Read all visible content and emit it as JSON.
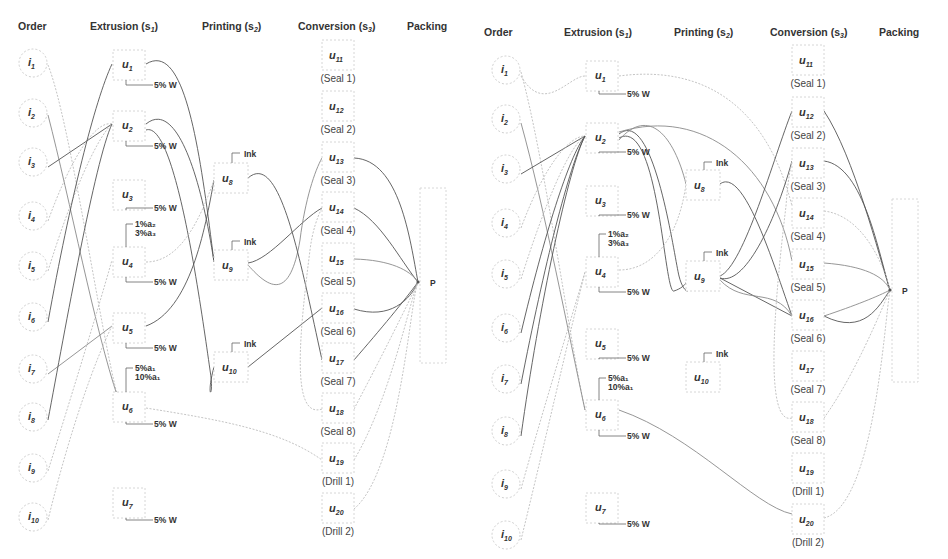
{
  "diagrams": [
    {
      "id": "left",
      "offset_x": 0,
      "offset_y": 0,
      "headers": [
        {
          "key": "order",
          "label": "Order",
          "x": 18,
          "y": 30
        },
        {
          "key": "extrusion",
          "label": "Extrusion (s",
          "sub": "1",
          "x": 90,
          "y": 30
        },
        {
          "key": "printing",
          "label": "Printing (s",
          "sub": "2",
          "x": 202,
          "y": 30
        },
        {
          "key": "conversion",
          "label": "Conversion (s",
          "sub": "3",
          "x": 298,
          "y": 30
        },
        {
          "key": "packing",
          "label": "Packing",
          "x": 407,
          "y": 30
        }
      ],
      "orders": [
        {
          "id": "i1",
          "label": "i",
          "sub": "1",
          "cx": 33,
          "cy": 63
        },
        {
          "id": "i2",
          "label": "i",
          "sub": "2",
          "cx": 33,
          "cy": 113
        },
        {
          "id": "i3",
          "label": "i",
          "sub": "3",
          "cx": 33,
          "cy": 162
        },
        {
          "id": "i4",
          "label": "i",
          "sub": "4",
          "cx": 33,
          "cy": 216
        },
        {
          "id": "i5",
          "label": "i",
          "sub": "5",
          "cx": 33,
          "cy": 266
        },
        {
          "id": "i6",
          "label": "i",
          "sub": "6",
          "cx": 33,
          "cy": 317
        },
        {
          "id": "i7",
          "label": "i",
          "sub": "7",
          "cx": 33,
          "cy": 369
        },
        {
          "id": "i8",
          "label": "i",
          "sub": "8",
          "cx": 33,
          "cy": 417
        },
        {
          "id": "i9",
          "label": "i",
          "sub": "9",
          "cx": 33,
          "cy": 468
        },
        {
          "id": "i10",
          "label": "i",
          "sub": "10",
          "cx": 33,
          "cy": 517
        }
      ],
      "extruders": [
        {
          "id": "u1",
          "label": "u",
          "sub": "1",
          "x": 113,
          "y": 50,
          "w": 32,
          "w2": 30,
          "note": "5% W",
          "note_y": 88
        },
        {
          "id": "u2",
          "label": "u",
          "sub": "2",
          "x": 113,
          "y": 111,
          "w": 32,
          "w2": 30,
          "note": "5% W",
          "note_y": 149
        },
        {
          "id": "u3",
          "label": "u",
          "sub": "3",
          "x": 113,
          "y": 180,
          "w": 32,
          "w2": 30,
          "note": "5% W",
          "note_y": 211
        },
        {
          "id": "u4",
          "label": "u",
          "sub": "4",
          "x": 113,
          "y": 247,
          "w": 32,
          "w2": 30,
          "note": "5% W",
          "note_y": 285,
          "pre": [
            "1%a₂",
            "3%a₃"
          ],
          "pre_y": 230
        },
        {
          "id": "u5",
          "label": "u",
          "sub": "5",
          "x": 113,
          "y": 313,
          "w": 32,
          "w2": 30,
          "note": "5% W",
          "note_y": 351
        },
        {
          "id": "u6",
          "label": "u",
          "sub": "6",
          "x": 113,
          "y": 392,
          "w": 32,
          "w2": 30,
          "note": "5% W",
          "note_y": 427,
          "pre": [
            "5%a₁",
            "10%a₁"
          ],
          "pre_y": 374
        },
        {
          "id": "u7",
          "label": "u",
          "sub": "7",
          "x": 113,
          "y": 488,
          "w": 32,
          "w2": 30,
          "note": "5% W",
          "note_y": 523
        }
      ],
      "printers": [
        {
          "id": "u8",
          "label": "u",
          "sub": "8",
          "x": 214,
          "y": 163,
          "w": 34,
          "h": 30,
          "note": "Ink",
          "note_y": 157
        },
        {
          "id": "u9",
          "label": "u",
          "sub": "9",
          "x": 214,
          "y": 250,
          "w": 34,
          "h": 30,
          "note": "Ink",
          "note_y": 245
        },
        {
          "id": "u10",
          "label": "u",
          "sub": "10",
          "x": 214,
          "y": 352,
          "w": 34,
          "h": 30,
          "note": "Ink",
          "note_y": 347
        }
      ],
      "converters": [
        {
          "id": "u11",
          "label": "u",
          "sub": "11",
          "cap": "(Seal 1)",
          "x": 322,
          "y": 40
        },
        {
          "id": "u12",
          "label": "u",
          "sub": "12",
          "cap": "(Seal 2)",
          "x": 322,
          "y": 91
        },
        {
          "id": "u13",
          "label": "u",
          "sub": "13",
          "cap": "(Seal 3)",
          "x": 322,
          "y": 142
        },
        {
          "id": "u14",
          "label": "u",
          "sub": "14",
          "cap": "(Seal 4)",
          "x": 322,
          "y": 192
        },
        {
          "id": "u15",
          "label": "u",
          "sub": "15",
          "cap": "(Seal 5)",
          "x": 322,
          "y": 243
        },
        {
          "id": "u16",
          "label": "u",
          "sub": "16",
          "cap": "(Seal 6)",
          "x": 322,
          "y": 293
        },
        {
          "id": "u17",
          "label": "u",
          "sub": "17",
          "cap": "(Seal 7)",
          "x": 322,
          "y": 343
        },
        {
          "id": "u18",
          "label": "u",
          "sub": "18",
          "cap": "(Seal 8)",
          "x": 322,
          "y": 393
        },
        {
          "id": "u19",
          "label": "u",
          "sub": "19",
          "cap": "(Drill 1)",
          "x": 322,
          "y": 443
        },
        {
          "id": "u20",
          "label": "u",
          "sub": "20",
          "cap": "(Drill 2)",
          "x": 322,
          "y": 493
        }
      ],
      "packing": {
        "label": "P",
        "x": 420,
        "y": 188,
        "w": 26,
        "h": 175,
        "px": 418,
        "py": 282
      },
      "edges": [
        {
          "d": "M48,65 C70,120 100,330 118,398",
          "style": "light"
        },
        {
          "d": "M48,115 C70,200 95,330 118,398",
          "style": "mid"
        },
        {
          "d": "M48,167 L112,124",
          "style": ""
        },
        {
          "d": "M48,221 C70,160 95,120 112,124",
          "style": "light"
        },
        {
          "d": "M48,271 C70,200 95,140 112,124",
          "style": "light"
        },
        {
          "d": "M48,322 C70,200 95,100 112,64",
          "style": ""
        },
        {
          "d": "M48,374 L112,326",
          "style": "mid"
        },
        {
          "d": "M48,420 C65,330 95,160 112,124",
          "style": ""
        },
        {
          "d": "M48,471 C70,400 95,320 112,260",
          "style": "light"
        },
        {
          "d": "M48,520 C70,430 95,360 112,326",
          "style": "light"
        },
        {
          "d": "M146,64 C185,40 200,150 214,262",
          "style": ""
        },
        {
          "d": "M146,124 C175,100 200,170 214,262",
          "style": ""
        },
        {
          "d": "M146,130 C175,120 200,300 210,370 C215,400 205,400 214,367",
          "style": ""
        },
        {
          "d": "M146,326 C190,310 205,230 214,180",
          "style": ""
        },
        {
          "d": "M146,262 C180,262 200,220 214,180",
          "style": "light"
        },
        {
          "d": "M248,263 C270,260 300,220 322,208",
          "style": ""
        },
        {
          "d": "M248,265 C270,290 290,300 300,240 C305,200 315,170 322,158",
          "style": "mid"
        },
        {
          "d": "M248,178 C280,150 300,260 322,360",
          "style": ""
        },
        {
          "d": "M248,367 L322,308",
          "style": ""
        },
        {
          "d": "M354,158 C400,160 410,240 418,282",
          "style": ""
        },
        {
          "d": "M354,208 C380,220 400,260 418,282",
          "style": ""
        },
        {
          "d": "M354,259 C390,260 410,270 418,282",
          "style": "mid"
        },
        {
          "d": "M354,309 C390,320 410,300 418,282",
          "style": ""
        },
        {
          "d": "M354,360 C380,330 405,300 418,282",
          "style": ""
        },
        {
          "d": "M354,409 C380,360 410,300 418,282",
          "style": "light"
        },
        {
          "d": "M354,460 C390,400 410,300 418,282",
          "style": "light"
        },
        {
          "d": "M354,509 C400,470 410,300 418,282",
          "style": "light"
        },
        {
          "d": "M146,408 C220,420 280,430 322,460",
          "style": "light"
        },
        {
          "d": "M322,409 C290,420 300,330 310,250 C315,210 330,200 322,200",
          "style": "light"
        }
      ]
    },
    {
      "id": "right",
      "offset_x": 474,
      "offset_y": 6,
      "headers": [
        {
          "key": "order",
          "label": "Order",
          "x": 10,
          "y": 30
        },
        {
          "key": "extrusion",
          "label": "Extrusion (s",
          "sub": "1",
          "x": 90,
          "y": 30
        },
        {
          "key": "printing",
          "label": "Printing (s",
          "sub": "2",
          "x": 200,
          "y": 30
        },
        {
          "key": "conversion",
          "label": "Conversion (s",
          "sub": "3",
          "x": 296,
          "y": 30
        },
        {
          "key": "packing",
          "label": "Packing",
          "x": 405,
          "y": 30
        }
      ],
      "orders": [
        {
          "id": "i1",
          "label": "i",
          "sub": "1",
          "cx": 32,
          "cy": 64
        },
        {
          "id": "i2",
          "label": "i",
          "sub": "2",
          "cx": 32,
          "cy": 113
        },
        {
          "id": "i3",
          "label": "i",
          "sub": "3",
          "cx": 32,
          "cy": 163
        },
        {
          "id": "i4",
          "label": "i",
          "sub": "4",
          "cx": 32,
          "cy": 217
        },
        {
          "id": "i5",
          "label": "i",
          "sub": "5",
          "cx": 32,
          "cy": 268
        },
        {
          "id": "i6",
          "label": "i",
          "sub": "6",
          "cx": 32,
          "cy": 322
        },
        {
          "id": "i7",
          "label": "i",
          "sub": "7",
          "cx": 32,
          "cy": 373
        },
        {
          "id": "i8",
          "label": "i",
          "sub": "8",
          "cx": 32,
          "cy": 425
        },
        {
          "id": "i9",
          "label": "i",
          "sub": "9",
          "cx": 32,
          "cy": 478
        },
        {
          "id": "i10",
          "label": "i",
          "sub": "10",
          "cx": 32,
          "cy": 529
        }
      ],
      "extruders": [
        {
          "id": "u1",
          "label": "u",
          "sub": "1",
          "x": 112,
          "y": 55,
          "w": 32,
          "w2": 30,
          "note": "5% W",
          "note_y": 91
        },
        {
          "id": "u2",
          "label": "u",
          "sub": "2",
          "x": 112,
          "y": 117,
          "w": 32,
          "w2": 30,
          "note": "5% W",
          "note_y": 149
        },
        {
          "id": "u3",
          "label": "u",
          "sub": "3",
          "x": 112,
          "y": 180,
          "w": 32,
          "w2": 30,
          "note": "5% W",
          "note_y": 212
        },
        {
          "id": "u4",
          "label": "u",
          "sub": "4",
          "x": 112,
          "y": 251,
          "w": 32,
          "w2": 30,
          "note": "5% W",
          "note_y": 289,
          "pre": [
            "1%a₂",
            "3%a₃"
          ],
          "pre_y": 234
        },
        {
          "id": "u5",
          "label": "u",
          "sub": "5",
          "x": 112,
          "y": 323,
          "w": 32,
          "w2": 30,
          "note": "5% W",
          "note_y": 355
        },
        {
          "id": "u6",
          "label": "u",
          "sub": "6",
          "x": 112,
          "y": 394,
          "w": 32,
          "w2": 30,
          "note": "5% W",
          "note_y": 433,
          "pre": [
            "5%a₁",
            "10%a₁"
          ],
          "pre_y": 378
        },
        {
          "id": "u7",
          "label": "u",
          "sub": "7",
          "x": 112,
          "y": 487,
          "w": 32,
          "w2": 30,
          "note": "5% W",
          "note_y": 521
        }
      ],
      "printers": [
        {
          "id": "u8",
          "label": "u",
          "sub": "8",
          "x": 212,
          "y": 164,
          "w": 34,
          "h": 30,
          "note": "Ink",
          "note_y": 160
        },
        {
          "id": "u9",
          "label": "u",
          "sub": "9",
          "x": 212,
          "y": 255,
          "w": 34,
          "h": 30,
          "note": "Ink",
          "note_y": 250
        },
        {
          "id": "u10",
          "label": "u",
          "sub": "10",
          "x": 212,
          "y": 356,
          "w": 34,
          "h": 30,
          "note": "Ink",
          "note_y": 351
        }
      ],
      "converters": [
        {
          "id": "u11",
          "label": "u",
          "sub": "11",
          "cap": "(Seal 1)",
          "x": 318,
          "y": 39
        },
        {
          "id": "u12",
          "label": "u",
          "sub": "12",
          "cap": "(Seal 2)",
          "x": 318,
          "y": 91
        },
        {
          "id": "u13",
          "label": "u",
          "sub": "13",
          "cap": "(Seal 3)",
          "x": 318,
          "y": 142
        },
        {
          "id": "u14",
          "label": "u",
          "sub": "14",
          "cap": "(Seal 4)",
          "x": 318,
          "y": 192
        },
        {
          "id": "u15",
          "label": "u",
          "sub": "15",
          "cap": "(Seal 5)",
          "x": 318,
          "y": 243
        },
        {
          "id": "u16",
          "label": "u",
          "sub": "16",
          "cap": "(Seal 6)",
          "x": 318,
          "y": 294
        },
        {
          "id": "u17",
          "label": "u",
          "sub": "17",
          "cap": "(Seal 7)",
          "x": 318,
          "y": 345
        },
        {
          "id": "u18",
          "label": "u",
          "sub": "18",
          "cap": "(Seal 8)",
          "x": 318,
          "y": 396
        },
        {
          "id": "u19",
          "label": "u",
          "sub": "19",
          "cap": "(Drill 1)",
          "x": 318,
          "y": 447
        },
        {
          "id": "u20",
          "label": "u",
          "sub": "20",
          "cap": "(Drill 2)",
          "x": 318,
          "y": 498
        }
      ],
      "packing": {
        "label": "P",
        "x": 418,
        "y": 193,
        "w": 26,
        "h": 183,
        "px": 416,
        "py": 284
      },
      "edges": [
        {
          "d": "M47,66 C70,150 95,330 111,404",
          "style": "light"
        },
        {
          "d": "M47,117 C70,200 95,330 111,404",
          "style": "mid"
        },
        {
          "d": "M47,168 L111,130",
          "style": ""
        },
        {
          "d": "M47,222 C70,160 95,130 111,130",
          "style": "light"
        },
        {
          "d": "M47,273 C70,200 95,140 111,130",
          "style": "light"
        },
        {
          "d": "M47,327 C70,230 95,150 111,130",
          "style": ""
        },
        {
          "d": "M47,378 C70,260 95,160 111,130",
          "style": ""
        },
        {
          "d": "M47,430 C65,300 95,160 111,130",
          "style": ""
        },
        {
          "d": "M47,483 C70,400 95,320 111,266",
          "style": "light"
        },
        {
          "d": "M47,534 C70,440 95,330 111,266",
          "style": "light"
        },
        {
          "d": "M47,70 C70,110 95,70 111,70",
          "style": "light"
        },
        {
          "d": "M145,70 C220,60 290,90 318,200",
          "style": "light"
        },
        {
          "d": "M145,128 C180,100 200,250 205,270 C210,290 220,290 212,270",
          "style": ""
        },
        {
          "d": "M145,132 C185,110 190,290 200,285 C215,280 215,270 212,270",
          "style": ""
        },
        {
          "d": "M145,134 C175,100 200,130 212,178",
          "style": "mid"
        },
        {
          "d": "M145,126 C230,100 300,160 318,255",
          "style": "mid"
        },
        {
          "d": "M145,264 C180,264 205,230 212,178",
          "style": "light"
        },
        {
          "d": "M246,178 C270,160 300,260 318,310",
          "style": ""
        },
        {
          "d": "M246,270 C270,260 300,150 318,105",
          "style": ""
        },
        {
          "d": "M246,272 C270,280 300,220 318,155",
          "style": ""
        },
        {
          "d": "M246,272 L318,310",
          "style": ""
        },
        {
          "d": "M246,274 C270,300 300,280 318,310",
          "style": "mid"
        },
        {
          "d": "M145,404 C220,430 280,500 318,508",
          "style": "mid"
        },
        {
          "d": "M350,105 C380,150 405,250 416,284",
          "style": ""
        },
        {
          "d": "M350,155 C390,160 405,250 416,284",
          "style": ""
        },
        {
          "d": "M350,205 C390,210 410,260 416,284",
          "style": "light"
        },
        {
          "d": "M350,257 C390,260 410,270 416,284",
          "style": "mid"
        },
        {
          "d": "M350,310 C390,330 405,300 416,284",
          "style": ""
        },
        {
          "d": "M350,310 C380,300 405,290 416,284",
          "style": "mid"
        },
        {
          "d": "M350,412 C380,370 405,310 416,284",
          "style": "light"
        },
        {
          "d": "M350,512 C400,500 410,320 416,284",
          "style": "light"
        },
        {
          "d": "M318,412 C290,420 300,300 312,200 C315,160 318,160 318,155",
          "style": "light"
        }
      ]
    }
  ]
}
